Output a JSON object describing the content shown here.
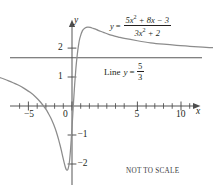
{
  "figure": {
    "note": "NOT TO SCALE",
    "axis_x_name": "x",
    "axis_y_name": "y",
    "equation": {
      "lhs": "y",
      "equals": "=",
      "numerator_a": "5x",
      "numerator_a_exp": "2",
      "numerator_b": " + 8x − 3",
      "denominator_a": "3x",
      "denominator_a_exp": "2",
      "denominator_b": " + 2"
    },
    "line_label": {
      "text": "Line",
      "var": "y",
      "equals": "=",
      "num": "5",
      "den": "3"
    },
    "x_tick_labels": [
      "−5",
      "0",
      "5",
      "10"
    ],
    "y_tick_labels": [
      "2",
      "1",
      "−1",
      "−2"
    ]
  },
  "colors": {
    "curve": "#8c8c8c",
    "axis": "#4d4d4d",
    "asymptote": "#595959",
    "text": "#231f20",
    "background": "#ffffff"
  },
  "chart_data": {
    "type": "line",
    "title": "",
    "xlabel": "x",
    "ylabel": "y",
    "xlim": [
      -7.2,
      11.2
    ],
    "ylim": [
      -2.6,
      3.0
    ],
    "grid": false,
    "legend": "none",
    "x_ticks": [
      -5,
      0,
      5,
      10
    ],
    "x_minor_ticks": [
      -6,
      -4,
      -3,
      -2,
      -1,
      1,
      2,
      3,
      4,
      6,
      7,
      8,
      9,
      11
    ],
    "y_ticks": [
      2,
      1,
      -1,
      -2
    ],
    "annotations": [
      {
        "text": "y = (5x^2 + 8x - 3)/(3x^2 + 2)",
        "x": 4.2,
        "y": 2.85
      },
      {
        "text": "Line y = 5/3",
        "x": 3.6,
        "y": 1.25
      },
      {
        "text": "NOT TO SCALE",
        "x": 6.0,
        "y": -2.3
      }
    ],
    "series": [
      {
        "name": "y = (5x^2 + 8x - 3)/(3x^2 + 2)",
        "color": "#8c8c8c",
        "x": [
          -7.2,
          -6.8,
          -6.4,
          -6.0,
          -5.6,
          -5.2,
          -4.8,
          -4.4,
          -4.0,
          -3.6,
          -3.2,
          -2.8,
          -2.4,
          -2.0,
          -1.8,
          -1.6,
          -1.4,
          -1.2,
          -1.0,
          -0.9,
          -0.8,
          -0.7,
          -0.6,
          -0.5,
          -0.45,
          -0.4,
          -0.35,
          -0.3,
          -0.2,
          -0.1,
          0.0,
          0.1,
          0.2,
          0.3,
          0.4,
          0.5,
          0.6,
          0.8,
          1.0,
          1.2,
          1.4,
          1.6,
          1.8,
          2.0,
          2.4,
          2.8,
          3.2,
          3.6,
          4.0,
          5.0,
          6.0,
          7.0,
          8.0,
          9.0,
          10.0,
          11.2
        ],
        "y": [
          1.17,
          1.13,
          1.09,
          1.04,
          0.99,
          0.93,
          0.86,
          0.78,
          0.7,
          0.59,
          0.47,
          0.32,
          0.13,
          -0.11,
          -0.26,
          -0.43,
          -0.64,
          -0.89,
          -1.2,
          -1.37,
          -1.56,
          -1.76,
          -1.95,
          -2.12,
          -2.18,
          -2.21,
          -2.21,
          -2.17,
          -1.94,
          -1.43,
          -0.75,
          0.02,
          0.72,
          1.31,
          1.76,
          2.1,
          2.34,
          2.6,
          2.69,
          2.72,
          2.71,
          2.68,
          2.65,
          2.61,
          2.54,
          2.47,
          2.42,
          2.37,
          2.33,
          2.25,
          2.18,
          2.13,
          2.09,
          2.06,
          2.03,
          2.0
        ]
      },
      {
        "name": "Line y = 5/3",
        "color": "#595959",
        "constant_y": 1.6667,
        "x": [
          -7.2,
          11.2
        ],
        "y": [
          1.6667,
          1.6667
        ]
      }
    ]
  }
}
